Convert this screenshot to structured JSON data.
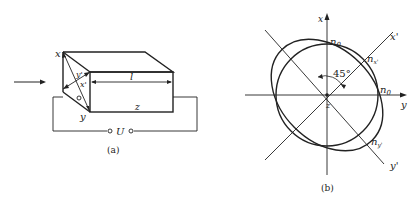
{
  "figure_a": {
    "caption": "(a)",
    "labels": {
      "x": "x",
      "y": "y",
      "x_prime": "x'",
      "y_prime": "y'",
      "l": "l",
      "z": "z",
      "o": "o",
      "U": "U"
    }
  },
  "figure_b": {
    "caption": "(b)",
    "labels": {
      "x_axis": "x",
      "y_axis": "y",
      "x_prime_axis": "x'",
      "y_prime_axis": "y'",
      "z": "z",
      "angle": "45°",
      "n0_top": "n",
      "n0_top_sub": "0",
      "n0_right": "n",
      "n0_right_sub": "0",
      "nx_prime": "n",
      "nx_prime_sub": "x'",
      "ny_prime": "n",
      "ny_prime_sub": "y'"
    }
  }
}
